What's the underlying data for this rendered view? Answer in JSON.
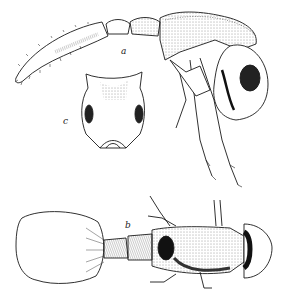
{
  "figure": {
    "labels": {
      "a": "a",
      "b": "b",
      "c": "c"
    },
    "views": [
      {
        "id": "a",
        "description": "lateral view of insect (head, thorax, abdomen, legs)"
      },
      {
        "id": "b",
        "description": "dorsal view of insect with enlarged abdomen"
      },
      {
        "id": "c",
        "description": "head/pronotum frontal view with two dark eyes"
      }
    ],
    "colors": {
      "ink": "#1a1a1a",
      "background": "#ffffff"
    }
  }
}
